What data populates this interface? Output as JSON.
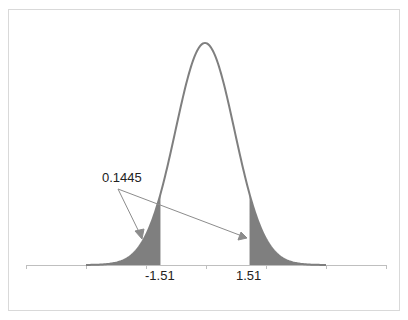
{
  "chart_data": {
    "type": "area",
    "title": "",
    "x_range": [
      -6,
      6
    ],
    "mean": 0,
    "sd": 1,
    "critical_values": [
      -1.51,
      1.51
    ],
    "tick_labels": [
      "-1.51",
      "1.51"
    ],
    "annotation": {
      "text": "0.1445",
      "arrows_to": [
        "left-tail",
        "right-tail"
      ]
    },
    "grid": false,
    "legend": null,
    "colors": {
      "curve": "#7f7f7f",
      "shade": "#7f7f7f",
      "axis": "#bfbfbf",
      "border": "#d9d9d9"
    }
  },
  "labels": {
    "annotation": "0.1445",
    "left_critical": "-1.51",
    "right_critical": "1.51"
  }
}
